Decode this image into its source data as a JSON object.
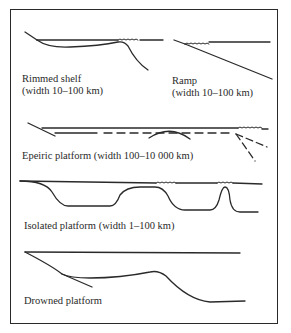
{
  "figure": {
    "panels": [
      {
        "id": "rimmed-shelf",
        "title": "Rimmed shelf",
        "subtitle": "(width 10–100 km)"
      },
      {
        "id": "ramp",
        "title": "Ramp",
        "subtitle": "(width 10–100 km)"
      },
      {
        "id": "epeiric-platform",
        "title": "Epeiric platform (width 100–10 000 km)"
      },
      {
        "id": "isolated-platform",
        "title": "Isolated platform (width 1–100 km)"
      },
      {
        "id": "drowned-platform",
        "title": "Drowned platform"
      }
    ],
    "colors": {
      "ink": "#2a2a2a",
      "background": "#ffffff"
    }
  }
}
